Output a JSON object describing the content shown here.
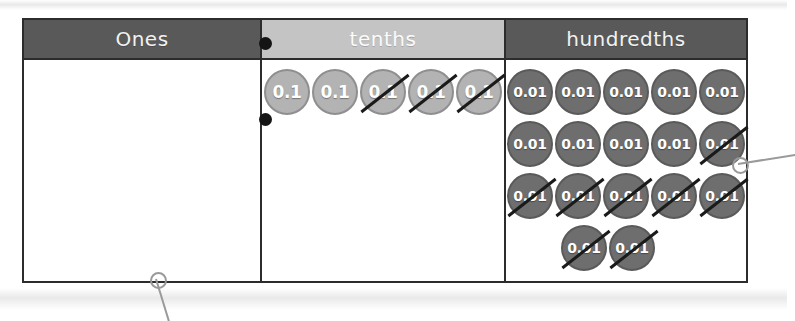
{
  "chart": {
    "columns": [
      {
        "id": "ones",
        "label": "Ones",
        "header_bg": "#595959",
        "header_text": "#f2f2f2"
      },
      {
        "id": "tenths",
        "label": "tenths",
        "header_bg": "#c4c4c4",
        "header_text": "#fbfbfb"
      },
      {
        "id": "hundredths",
        "label": "hundredths",
        "header_bg": "#595959",
        "header_text": "#f2f2f2"
      }
    ],
    "ones_column": {
      "discs": [],
      "count": 0
    },
    "tenths_column": {
      "disc_value": "0.1",
      "disc_color": "#b3b3b3",
      "rows": [
        {
          "discs": [
            {
              "value": "0.1",
              "crossed": false
            },
            {
              "value": "0.1",
              "crossed": false
            },
            {
              "value": "0.1",
              "crossed": true
            },
            {
              "value": "0.1",
              "crossed": true
            },
            {
              "value": "0.1",
              "crossed": true
            }
          ]
        }
      ],
      "total": 5,
      "crossed_out": 3,
      "remaining": 2
    },
    "hundredths_column": {
      "disc_value": "0.01",
      "disc_color": "#6e6e6e",
      "rows": [
        {
          "discs": [
            {
              "value": "0.01",
              "crossed": false
            },
            {
              "value": "0.01",
              "crossed": false
            },
            {
              "value": "0.01",
              "crossed": false
            },
            {
              "value": "0.01",
              "crossed": false
            },
            {
              "value": "0.01",
              "crossed": false
            }
          ]
        },
        {
          "discs": [
            {
              "value": "0.01",
              "crossed": false
            },
            {
              "value": "0.01",
              "crossed": false
            },
            {
              "value": "0.01",
              "crossed": false
            },
            {
              "value": "0.01",
              "crossed": false
            },
            {
              "value": "0.01",
              "crossed": true
            }
          ]
        },
        {
          "discs": [
            {
              "value": "0.01",
              "crossed": true
            },
            {
              "value": "0.01",
              "crossed": true
            },
            {
              "value": "0.01",
              "crossed": true
            },
            {
              "value": "0.01",
              "crossed": true
            },
            {
              "value": "0.01",
              "crossed": true
            }
          ]
        },
        {
          "discs": [
            {
              "value": "0.01",
              "crossed": true
            },
            {
              "value": "0.01",
              "crossed": true
            }
          ]
        }
      ],
      "total": 17,
      "crossed_out": 12,
      "remaining": 5
    },
    "decimal_points": [
      {
        "name": "decimal-point-header",
        "x": 259,
        "y": 37
      },
      {
        "name": "decimal-point-body",
        "x": 259,
        "y": 113
      }
    ],
    "callouts": [
      {
        "name": "callout-bottom-left",
        "ring_x": 150,
        "ring_y": 272,
        "line_angle_deg": 73,
        "line_length": 44
      },
      {
        "name": "callout-right",
        "ring_x": 732,
        "ring_y": 157,
        "line_angle_deg": -9,
        "line_length": 58
      }
    ],
    "colors": {
      "border": "#2c2c2c",
      "header_dark": "#595959",
      "header_light": "#c4c4c4",
      "tenth_disc": "#b3b3b3",
      "hundredth_disc": "#6e6e6e",
      "cross_stroke": "#1a1a1a",
      "callout": "#9a9a9a",
      "page": "#ffffff"
    }
  }
}
